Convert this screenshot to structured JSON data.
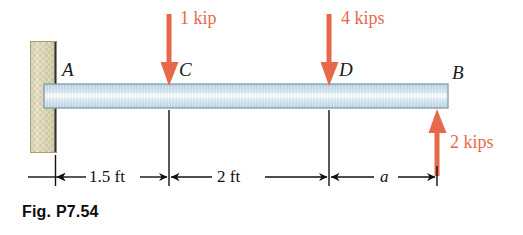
{
  "figure": {
    "caption": "Fig. P7.54",
    "type": "beam-free-body-diagram",
    "colors": {
      "force_arrow": "#e8694a",
      "beam_fill": "#cfe0ec",
      "beam_edge": "#6f8ea3",
      "wall_fill": "#d8d2b0",
      "wall_edge": "#3c3c3c",
      "dimension_line": "#111111",
      "label_text": "#1a1a1a"
    }
  },
  "support": {
    "name": "fixed-wall-support",
    "description": "hatched vertical wall block at left end"
  },
  "beam": {
    "name": "horizontal-beam",
    "left_point": "A",
    "right_point": "B"
  },
  "points": [
    {
      "id": "A",
      "label": "A"
    },
    {
      "id": "C",
      "label": "C"
    },
    {
      "id": "D",
      "label": "D"
    },
    {
      "id": "B",
      "label": "B"
    }
  ],
  "forces": [
    {
      "id": "force-at-C",
      "label": "1 kip",
      "magnitude": 1,
      "unit": "kip",
      "direction": "down",
      "at_point": "C"
    },
    {
      "id": "force-at-D",
      "label": "4 kips",
      "magnitude": 4,
      "unit": "kips",
      "direction": "down",
      "at_point": "D"
    },
    {
      "id": "force-at-B",
      "label": "2 kips",
      "magnitude": 2,
      "unit": "kips",
      "direction": "up",
      "at_point": "B"
    }
  ],
  "dimensions": [
    {
      "id": "dim-A-C",
      "label": "1.5 ft",
      "value": 1.5,
      "unit": "ft",
      "from": "A",
      "to": "C"
    },
    {
      "id": "dim-C-D",
      "label": "2 ft",
      "value": 2,
      "unit": "ft",
      "from": "C",
      "to": "D"
    },
    {
      "id": "dim-D-B",
      "label": "a",
      "value": null,
      "unit": "ft",
      "from": "D",
      "to": "B"
    }
  ]
}
